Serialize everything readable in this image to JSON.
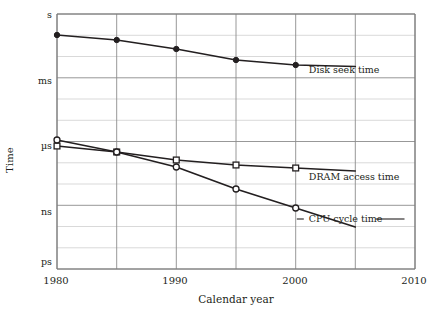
{
  "chart_data": {
    "type": "line",
    "title": "",
    "xlabel": "Calendar year",
    "ylabel": "Time",
    "xlim": [
      1980,
      2010
    ],
    "ylim_labels": [
      "ps",
      "ns",
      "µs",
      "ms",
      "s"
    ],
    "xticks": [
      1980,
      1990,
      2000,
      2010
    ],
    "xtick_labels": [
      "1980",
      "1990",
      "2000",
      "2010"
    ],
    "x_gridlines": [
      1980,
      1985,
      1990,
      1995,
      2000,
      2005,
      2010
    ],
    "yticks_labeled": [
      "s",
      "ms",
      "µs",
      "ns",
      "ps"
    ],
    "grid": true,
    "legend": "inline-annotations",
    "y_axis_note": "logarithmic, decades from ps (bottom) to s (top)",
    "series": [
      {
        "name": "Disk seek time",
        "marker": "filled-circle",
        "label_x": 2001.1,
        "label_y_px": 73,
        "line_extends_to": 2005,
        "x": [
          1980,
          1985,
          1990,
          1995,
          2000
        ],
        "y_px": [
          35,
          40,
          49,
          60,
          65
        ]
      },
      {
        "name": "DRAM access time",
        "marker": "open-square",
        "label_x": 2001.1,
        "label_y_px": 180,
        "line_extends_to": 2005,
        "x": [
          1980,
          1985,
          1990,
          1995,
          2000
        ],
        "y_px": [
          146,
          152,
          160,
          165,
          168
        ]
      },
      {
        "name": "CPU cycle time",
        "marker": "open-circle",
        "label_x": 2001.1,
        "label_y_px": 222,
        "line_extends_to": 2005,
        "leader_line": true,
        "x": [
          1980,
          1985,
          1990,
          1995,
          2000
        ],
        "y_px": [
          140,
          152,
          167,
          189,
          208
        ]
      }
    ],
    "annotations": [
      {
        "text": "Disk seek time"
      },
      {
        "text": "DRAM access time"
      },
      {
        "text": "CPU cycle time"
      }
    ],
    "colors": {
      "line": "#231f20",
      "grid_major": "#8c8c8c",
      "grid_minor": "#c9c9c9",
      "frame": "#7a7a7a",
      "text": "#231f20",
      "marker_fill": "#ffffff"
    }
  },
  "axis": {
    "y_title": "Time",
    "x_title": "Calendar year",
    "y_labels": [
      {
        "text": "s",
        "y": 14
      },
      {
        "text": "ms",
        "y": 80
      },
      {
        "text": "µs",
        "y": 145
      },
      {
        "text": "ns",
        "y": 211
      },
      {
        "text": "ps",
        "y": 261
      }
    ],
    "x_labels": [
      {
        "text": "1980",
        "x": 56
      },
      {
        "text": "1990",
        "x": 175
      },
      {
        "text": "2000",
        "x": 295
      },
      {
        "text": "2010",
        "x": 414
      }
    ]
  }
}
